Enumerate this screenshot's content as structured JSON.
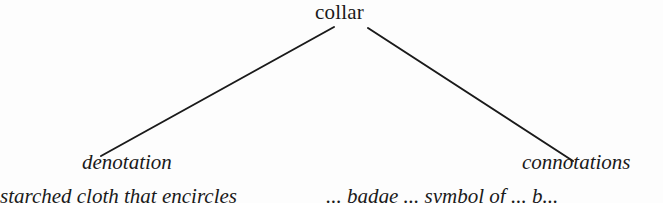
{
  "diagram": {
    "type": "tree",
    "root": {
      "label": "collar"
    },
    "children": [
      {
        "label": "denotation",
        "style": "italic"
      },
      {
        "label": "connotations",
        "style": "italic"
      }
    ],
    "glosses": {
      "left": "starched cloth that encircles",
      "right": "... badge ... symbol of ... b..."
    },
    "edges": [
      {
        "from": "collar",
        "to": "denotation",
        "x1": 334,
        "y1": 27,
        "x2": 101,
        "y2": 156
      },
      {
        "from": "collar",
        "to": "connotations",
        "x1": 368,
        "y1": 28,
        "x2": 573,
        "y2": 161
      }
    ],
    "colors": {
      "ink": "#1a1a1a",
      "background": "#fdfdfd"
    }
  }
}
